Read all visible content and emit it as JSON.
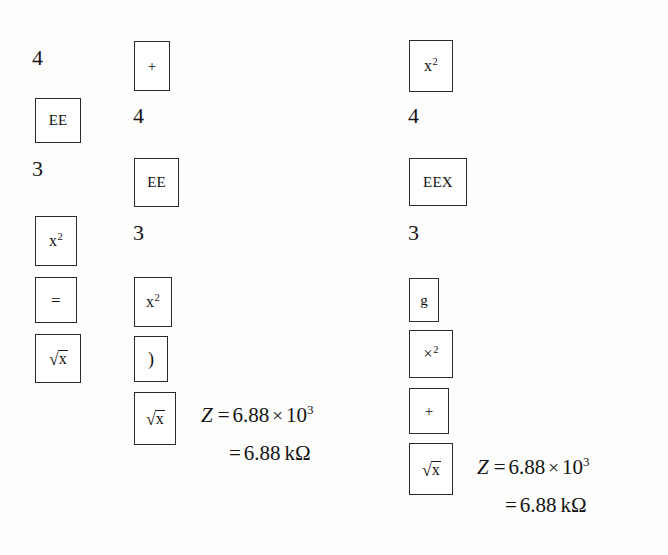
{
  "page": {
    "background_color": "#fdfdfc",
    "ink_color": "#1a1a1a"
  },
  "columns": [
    {
      "id": "column-1",
      "name": "keystroke-column-left",
      "steps": [
        {
          "kind": "digit",
          "label": "4"
        },
        {
          "kind": "key",
          "label": "EE"
        },
        {
          "kind": "digit",
          "label": "3"
        },
        {
          "kind": "key",
          "label": "x2",
          "base": "x",
          "exponent": "2"
        },
        {
          "kind": "key",
          "label": "="
        },
        {
          "kind": "key",
          "label": "sqrt-x",
          "radical": "x"
        }
      ],
      "result": null
    },
    {
      "id": "column-2",
      "name": "keystroke-column-middle",
      "steps": [
        {
          "kind": "key",
          "label": "+"
        },
        {
          "kind": "digit",
          "label": "4"
        },
        {
          "kind": "key",
          "label": "EE"
        },
        {
          "kind": "digit",
          "label": "3"
        },
        {
          "kind": "key",
          "label": "x2",
          "base": "x",
          "exponent": "2"
        },
        {
          "kind": "key",
          "label": ")"
        },
        {
          "kind": "key",
          "label": "sqrt-x",
          "radical": "x"
        }
      ],
      "result": {
        "line1": {
          "variable": "Z",
          "equals": "=",
          "mantissa": "6.88",
          "times": "×",
          "base": "10",
          "exponent": "3"
        },
        "line2": {
          "equals": "=",
          "value": "6.88",
          "unit": "kΩ"
        }
      }
    },
    {
      "id": "column-3",
      "name": "keystroke-column-right",
      "steps": [
        {
          "kind": "key",
          "label": "x2",
          "base": "x",
          "exponent": "2"
        },
        {
          "kind": "digit",
          "label": "4"
        },
        {
          "kind": "key",
          "label": "EEX"
        },
        {
          "kind": "digit",
          "label": "3"
        },
        {
          "kind": "key",
          "label": "g"
        },
        {
          "kind": "key",
          "label": "cross2",
          "base": "×",
          "exponent": "2"
        },
        {
          "kind": "key",
          "label": "+"
        },
        {
          "kind": "key",
          "label": "sqrt-x",
          "radical": "x"
        }
      ],
      "result": {
        "line1": {
          "variable": "Z",
          "equals": "=",
          "mantissa": "6.88",
          "times": "×",
          "base": "10",
          "exponent": "3"
        },
        "line2": {
          "equals": "=",
          "value": "6.88",
          "unit": "kΩ"
        }
      }
    }
  ]
}
